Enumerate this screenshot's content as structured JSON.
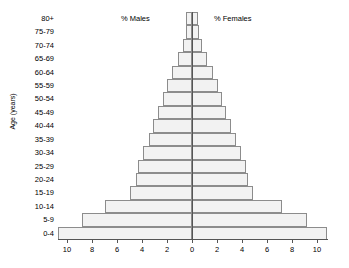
{
  "chart_data": {
    "type": "bar",
    "subtype": "population-pyramid",
    "title": "",
    "xlabel": "",
    "ylabel": "Age (years)",
    "grid": false,
    "legend_position": "inside-top",
    "axis_center": 0,
    "xlim": [
      -11,
      11
    ],
    "xticks": [
      10,
      8,
      6,
      4,
      2,
      0,
      2,
      4,
      6,
      8,
      10
    ],
    "xtick_unit": "%",
    "categories": [
      "80+",
      "75-79",
      "70-74",
      "65-69",
      "60-64",
      "55-59",
      "50-54",
      "45-49",
      "40-44",
      "35-39",
      "30-34",
      "25-29",
      "20-24",
      "15-19",
      "10-14",
      "5-9",
      "0-4"
    ],
    "series": [
      {
        "name": "% Males",
        "side": "left",
        "values": [
          0.45,
          0.5,
          0.75,
          1.15,
          1.6,
          2.0,
          2.35,
          2.7,
          3.1,
          3.45,
          3.9,
          4.3,
          4.45,
          4.95,
          7.0,
          8.8,
          10.7
        ]
      },
      {
        "name": "% Females",
        "side": "right",
        "values": [
          0.45,
          0.55,
          0.8,
          1.2,
          1.65,
          2.05,
          2.4,
          2.75,
          3.15,
          3.5,
          3.95,
          4.3,
          4.5,
          4.9,
          7.2,
          9.2,
          10.8
        ]
      }
    ]
  },
  "labels": {
    "ylabel": "Age (years)",
    "males_title": "% Males",
    "females_title": "% Females"
  }
}
